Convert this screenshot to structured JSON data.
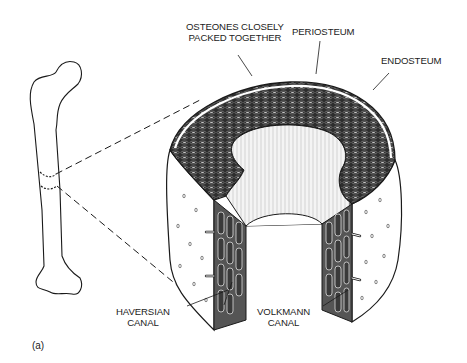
{
  "figure": {
    "panel_label": "(a)",
    "labels": {
      "osteones_line1": "OSTEONES CLOSELY",
      "osteones_line2": "PACKED TOGETHER",
      "periosteum": "PERIOSTEUM",
      "endosteum": "ENDOSTEUM",
      "haversian_line1": "HAVERSIAN",
      "haversian_line2": "CANAL",
      "volkmann_line1": "VOLKMANN",
      "volkmann_line2": "CANAL"
    },
    "colors": {
      "ink": "#1a1a1a",
      "osteon_fill": "#3a3a3a",
      "background": "#ffffff"
    }
  }
}
